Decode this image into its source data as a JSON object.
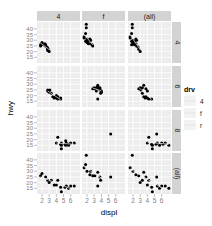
{
  "chart_data": {
    "type": "scatter",
    "title": "",
    "xlabel": "displ",
    "ylabel": "hwy",
    "xlim": [
      1.3,
      7.3
    ],
    "ylim": [
      10,
      46
    ],
    "x_ticks": [
      2,
      3,
      4,
      5,
      6
    ],
    "y_ticks": [
      15,
      20,
      25,
      30,
      35,
      40
    ],
    "grid": true,
    "facet_cols": [
      "4",
      "f",
      "(all)"
    ],
    "facet_rows": [
      "4",
      "6",
      "8",
      "(all)"
    ],
    "legend": {
      "title": "drv",
      "entries": [
        "4",
        "f",
        "r"
      ],
      "position": "right"
    },
    "smooth_color": "#f0f0f0",
    "panel_bg": "#ebebeb",
    "strip_bg": "#d3d3d3",
    "panels": [
      {
        "row": "4",
        "col": "4",
        "points": [
          [
            1.8,
            26
          ],
          [
            1.8,
            25
          ],
          [
            2.0,
            28
          ],
          [
            2.0,
            27
          ],
          [
            2.2,
            26
          ],
          [
            2.4,
            27
          ],
          [
            2.5,
            25
          ],
          [
            2.5,
            26
          ],
          [
            2.7,
            24
          ],
          [
            2.8,
            22
          ],
          [
            2.8,
            23
          ],
          [
            2.8,
            21
          ],
          [
            3.0,
            20
          ]
        ]
      },
      {
        "row": "4",
        "col": "f",
        "points": [
          [
            1.6,
            33
          ],
          [
            1.6,
            32
          ],
          [
            1.8,
            29
          ],
          [
            1.8,
            36
          ],
          [
            1.9,
            44
          ],
          [
            1.9,
            41
          ],
          [
            2.0,
            30
          ],
          [
            2.0,
            29
          ],
          [
            2.0,
            31
          ],
          [
            2.0,
            28
          ],
          [
            2.2,
            27
          ],
          [
            2.2,
            29
          ],
          [
            2.4,
            31
          ],
          [
            2.4,
            30
          ],
          [
            2.5,
            30
          ],
          [
            2.5,
            27
          ],
          [
            2.7,
            26
          ],
          [
            2.8,
            25
          ]
        ]
      },
      {
        "row": "4",
        "col": "(all)",
        "points": [
          [
            1.6,
            33
          ],
          [
            1.6,
            32
          ],
          [
            1.8,
            29
          ],
          [
            1.8,
            26
          ],
          [
            1.8,
            36
          ],
          [
            1.9,
            44
          ],
          [
            1.9,
            41
          ],
          [
            2.0,
            30
          ],
          [
            2.0,
            28
          ],
          [
            2.0,
            27
          ],
          [
            2.2,
            26
          ],
          [
            2.2,
            29
          ],
          [
            2.4,
            31
          ],
          [
            2.4,
            27
          ],
          [
            2.5,
            30
          ],
          [
            2.5,
            25
          ],
          [
            2.7,
            24
          ],
          [
            2.8,
            22
          ],
          [
            3.0,
            20
          ]
        ]
      },
      {
        "row": "6",
        "col": "4",
        "points": [
          [
            2.8,
            24
          ],
          [
            2.8,
            25
          ],
          [
            3.0,
            23
          ],
          [
            3.1,
            25
          ],
          [
            3.3,
            22
          ],
          [
            3.5,
            19
          ],
          [
            3.7,
            18
          ],
          [
            3.8,
            19
          ],
          [
            4.0,
            18
          ],
          [
            4.0,
            20
          ],
          [
            4.2,
            17
          ],
          [
            4.2,
            19
          ],
          [
            4.6,
            17
          ],
          [
            4.6,
            18
          ]
        ]
      },
      {
        "row": "6",
        "col": "f",
        "points": [
          [
            2.8,
            26
          ],
          [
            3.0,
            27
          ],
          [
            3.1,
            26
          ],
          [
            3.3,
            27
          ],
          [
            3.3,
            24
          ],
          [
            3.5,
            29
          ],
          [
            3.5,
            28
          ],
          [
            3.6,
            26
          ],
          [
            3.8,
            26
          ],
          [
            3.8,
            27
          ],
          [
            3.8,
            25
          ],
          [
            3.9,
            22
          ],
          [
            4.0,
            24
          ],
          [
            4.0,
            23
          ],
          [
            3.5,
            17
          ]
        ]
      },
      {
        "row": "6",
        "col": "(all)",
        "points": [
          [
            2.8,
            26
          ],
          [
            3.0,
            27
          ],
          [
            3.1,
            25
          ],
          [
            3.3,
            27
          ],
          [
            3.3,
            22
          ],
          [
            3.5,
            29
          ],
          [
            3.5,
            19
          ],
          [
            3.7,
            18
          ],
          [
            3.8,
            26
          ],
          [
            3.8,
            19
          ],
          [
            4.0,
            24
          ],
          [
            4.0,
            18
          ],
          [
            4.2,
            17
          ],
          [
            4.6,
            17
          ]
        ]
      },
      {
        "row": "8",
        "col": "4",
        "points": [
          [
            4.0,
            17
          ],
          [
            4.2,
            22
          ],
          [
            4.6,
            16
          ],
          [
            4.7,
            17
          ],
          [
            4.7,
            15
          ],
          [
            5.2,
            16
          ],
          [
            5.3,
            19
          ],
          [
            5.4,
            17
          ],
          [
            5.7,
            15
          ],
          [
            5.7,
            16
          ],
          [
            6.0,
            17
          ],
          [
            6.5,
            17
          ],
          [
            4.7,
            12
          ],
          [
            5.3,
            15
          ]
        ]
      },
      {
        "row": "8",
        "col": "f",
        "points": [
          [
            5.3,
            25
          ]
        ]
      },
      {
        "row": "8",
        "col": "(all)",
        "points": [
          [
            4.0,
            17
          ],
          [
            4.2,
            22
          ],
          [
            4.6,
            16
          ],
          [
            4.7,
            15
          ],
          [
            5.2,
            16
          ],
          [
            5.3,
            25
          ],
          [
            5.4,
            17
          ],
          [
            5.7,
            15
          ],
          [
            6.0,
            17
          ],
          [
            6.5,
            17
          ],
          [
            4.7,
            12
          ],
          [
            6.2,
            16
          ],
          [
            7.0,
            15
          ]
        ]
      },
      {
        "row": "(all)",
        "col": "4",
        "points": [
          [
            1.8,
            26
          ],
          [
            2.0,
            28
          ],
          [
            2.5,
            25
          ],
          [
            2.8,
            22
          ],
          [
            3.0,
            20
          ],
          [
            3.3,
            22
          ],
          [
            3.7,
            18
          ],
          [
            4.0,
            18
          ],
          [
            4.2,
            22
          ],
          [
            4.6,
            16
          ],
          [
            4.7,
            12
          ],
          [
            5.2,
            16
          ],
          [
            5.4,
            17
          ],
          [
            5.7,
            15
          ],
          [
            6.0,
            17
          ],
          [
            6.5,
            17
          ]
        ]
      },
      {
        "row": "(all)",
        "col": "f",
        "points": [
          [
            1.6,
            33
          ],
          [
            1.8,
            36
          ],
          [
            1.9,
            44
          ],
          [
            2.0,
            30
          ],
          [
            2.4,
            27
          ],
          [
            2.5,
            30
          ],
          [
            2.8,
            26
          ],
          [
            3.1,
            26
          ],
          [
            3.5,
            29
          ],
          [
            3.8,
            25
          ],
          [
            3.9,
            22
          ],
          [
            3.5,
            17
          ],
          [
            5.3,
            25
          ]
        ]
      },
      {
        "row": "(all)",
        "col": "(all)",
        "points": [
          [
            1.6,
            33
          ],
          [
            1.9,
            44
          ],
          [
            2.0,
            30
          ],
          [
            2.4,
            27
          ],
          [
            2.8,
            26
          ],
          [
            3.0,
            20
          ],
          [
            3.3,
            22
          ],
          [
            3.5,
            29
          ],
          [
            3.8,
            25
          ],
          [
            4.0,
            18
          ],
          [
            4.2,
            22
          ],
          [
            4.6,
            16
          ],
          [
            4.7,
            12
          ],
          [
            5.3,
            25
          ],
          [
            5.4,
            17
          ],
          [
            5.7,
            15
          ],
          [
            6.0,
            17
          ],
          [
            6.5,
            17
          ],
          [
            7.0,
            15
          ]
        ]
      }
    ]
  }
}
